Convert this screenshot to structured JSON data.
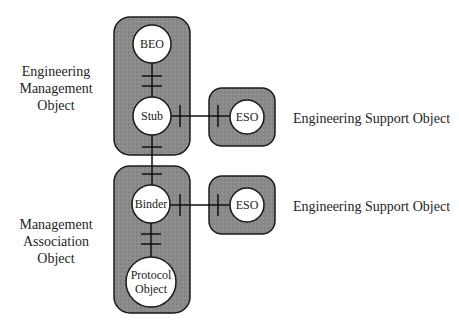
{
  "diagram": {
    "colors": {
      "container_fill": "#8a8a8a",
      "container_stroke": "#1a1a1a",
      "node_fill": "#ffffff",
      "line": "#111111",
      "background": "#ffffff"
    },
    "containers": [
      {
        "id": "engineering-management-object",
        "label": "Engineering\nManagement\nObject",
        "x": 114,
        "y": 17,
        "w": 76,
        "h": 138,
        "rx": 16
      },
      {
        "id": "management-association-object",
        "label": "Management\nAssociation\nObject",
        "x": 114,
        "y": 166,
        "w": 76,
        "h": 147,
        "rx": 16
      },
      {
        "id": "engineering-support-object-1",
        "label": "Engineering Support Object",
        "x": 209,
        "y": 88,
        "w": 66,
        "h": 58,
        "rx": 13
      },
      {
        "id": "engineering-support-object-2",
        "label": "Engineering Support Object",
        "x": 209,
        "y": 176,
        "w": 66,
        "h": 58,
        "rx": 13
      }
    ],
    "nodes": [
      {
        "id": "beo",
        "label": "BEO",
        "lines": [
          "BEO"
        ],
        "cx": 152,
        "cy": 44,
        "r": 19
      },
      {
        "id": "stub",
        "label": "Stub",
        "lines": [
          "Stub"
        ],
        "cx": 152,
        "cy": 116,
        "r": 19
      },
      {
        "id": "eso-1",
        "label": "ESO",
        "lines": [
          "ESO"
        ],
        "cx": 247,
        "cy": 117,
        "r": 17
      },
      {
        "id": "binder",
        "label": "Binder",
        "lines": [
          "Binder"
        ],
        "cx": 151,
        "cy": 204,
        "r": 19
      },
      {
        "id": "protocol-object",
        "label": "Protocol Object",
        "lines": [
          "Protocol",
          "Object"
        ],
        "cx": 151,
        "cy": 282,
        "r": 25
      },
      {
        "id": "eso-2",
        "label": "ESO",
        "lines": [
          "ESO"
        ],
        "cx": 247,
        "cy": 205,
        "r": 17
      }
    ],
    "connections": [
      {
        "from": "beo",
        "to": "stub",
        "orientation": "vertical",
        "x": 152,
        "y1": 63,
        "y2": 97,
        "ticks": [
          76,
          86
        ]
      },
      {
        "from": "stub",
        "to": "binder",
        "orientation": "vertical",
        "x": 152,
        "y1": 135,
        "y2": 185,
        "ticks": [
          147,
          174
        ]
      },
      {
        "from": "binder",
        "to": "protocol-object",
        "orientation": "vertical",
        "x": 151,
        "y1": 223,
        "y2": 257,
        "ticks": [
          234,
          244
        ]
      },
      {
        "from": "stub",
        "to": "eso-1",
        "orientation": "horizontal",
        "y": 116,
        "x1": 171,
        "x2": 230,
        "ticks": [
          180,
          218
        ]
      },
      {
        "from": "binder",
        "to": "eso-2",
        "orientation": "horizontal",
        "y": 205,
        "x1": 170,
        "x2": 230,
        "ticks": [
          180,
          218
        ]
      }
    ],
    "labels": {
      "left_top": "Engineering\nManagement\nObject",
      "left_bottom": "Management\nAssociation\nObject",
      "right_top": "Engineering Support Object",
      "right_bottom": "Engineering Support Object"
    }
  }
}
